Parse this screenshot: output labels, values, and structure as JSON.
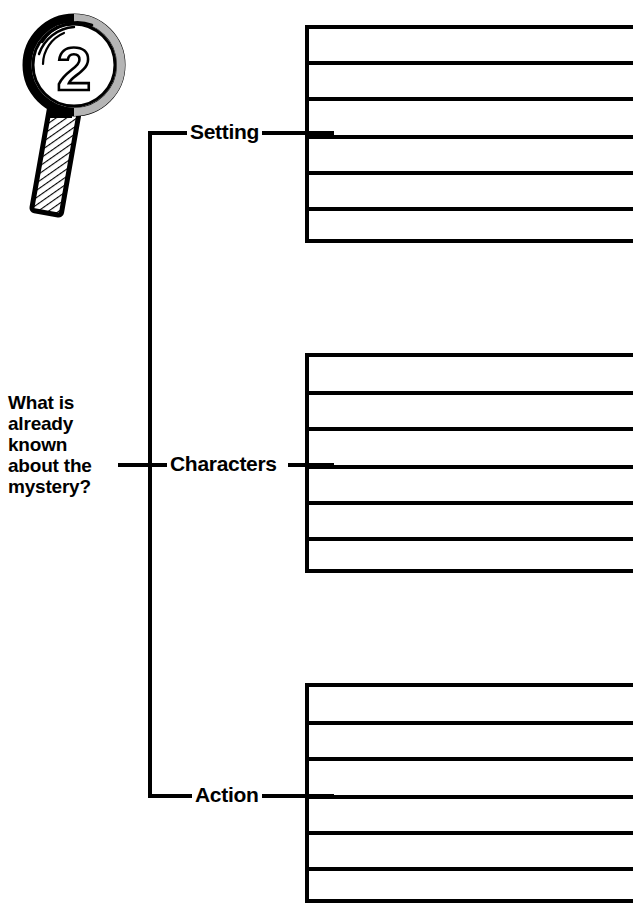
{
  "page": {
    "background_color": "#ffffff",
    "ink_color": "#000000",
    "width": 643,
    "height": 915
  },
  "header": {
    "left_remnant": "",
    "right_remnant": ""
  },
  "badge": {
    "icon": "magnifying-glass-icon",
    "step_number": "2"
  },
  "prompt": {
    "text": "What is already known about the mystery?",
    "lines": [
      "What is",
      "already",
      "known",
      "about the",
      "mystery?"
    ]
  },
  "branches": [
    {
      "id": "setting",
      "label": "Setting",
      "label_x": 188,
      "label_y": 120,
      "connector_y": 133,
      "block": {
        "top": 25,
        "height": 218,
        "rows": 6,
        "rule_ys": [
          0,
          36,
          72,
          110,
          146,
          182,
          214
        ]
      }
    },
    {
      "id": "characters",
      "label": "Characters",
      "label_x": 166,
      "label_y": 452,
      "connector_y": 465,
      "block": {
        "top": 353,
        "height": 220,
        "rows": 6,
        "rule_ys": [
          0,
          38,
          74,
          112,
          148,
          184,
          216
        ]
      }
    },
    {
      "id": "action",
      "label": "Action",
      "label_x": 193,
      "label_y": 783,
      "connector_y": 796,
      "block": {
        "top": 683,
        "height": 220,
        "rows": 6,
        "rule_ys": [
          0,
          38,
          74,
          112,
          148,
          184,
          216
        ]
      }
    }
  ],
  "trunk": {
    "x": 148,
    "top": 133,
    "bottom": 798,
    "stub_y": 465,
    "stub_from_x": 118
  },
  "writing_area": {
    "left": 305,
    "right": 633,
    "line_color": "#000000",
    "line_thickness": 4,
    "note": "blank ruled lines for student responses"
  }
}
